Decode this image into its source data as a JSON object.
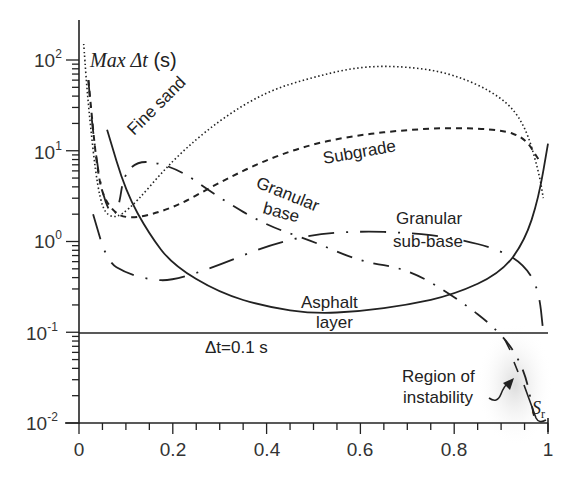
{
  "chart_data": {
    "type": "line",
    "title": "",
    "ylabel": "Max Δt (s)",
    "xlabel": "",
    "xlim": [
      0,
      1
    ],
    "ylim": [
      0.01,
      100
    ],
    "yscale": "log",
    "grid": false,
    "legend": "inline labels",
    "x_ticks": [
      "0",
      "0.2",
      "0.4",
      "0.6",
      "0.8",
      "1"
    ],
    "y_ticks": [
      {
        "base": "10",
        "exp": "2"
      },
      {
        "base": "10",
        "exp": "1"
      },
      {
        "base": "10",
        "exp": "0"
      },
      {
        "base": "10",
        "exp": "-1"
      },
      {
        "base": "10",
        "exp": "-2"
      }
    ],
    "series": [
      {
        "name": "Fine sand",
        "style": "dotted",
        "x": [
          0.01,
          0.02,
          0.04,
          0.06,
          0.1,
          0.2,
          0.3,
          0.4,
          0.5,
          0.6,
          0.7,
          0.8,
          0.9,
          0.95,
          0.98,
          0.99
        ],
        "y": [
          150,
          30,
          3.5,
          1.8,
          2.0,
          8,
          22,
          45,
          65,
          85,
          85,
          70,
          40,
          20,
          6,
          3
        ]
      },
      {
        "name": "Subgrade",
        "style": "dashed",
        "x": [
          0.02,
          0.04,
          0.06,
          0.1,
          0.2,
          0.3,
          0.4,
          0.5,
          0.6,
          0.7,
          0.8,
          0.9,
          0.95,
          0.98
        ],
        "y": [
          60,
          5,
          2.5,
          1.7,
          2.3,
          4.5,
          8,
          12,
          15,
          17,
          18,
          17,
          14,
          8
        ]
      },
      {
        "name": "Asphalt layer",
        "style": "solid",
        "x": [
          0.06,
          0.1,
          0.15,
          0.2,
          0.3,
          0.4,
          0.5,
          0.6,
          0.7,
          0.8,
          0.9,
          0.95,
          0.98,
          1.0
        ],
        "y": [
          17,
          3.5,
          1.2,
          0.55,
          0.27,
          0.19,
          0.16,
          0.17,
          0.2,
          0.26,
          0.45,
          1.0,
          3.0,
          12
        ]
      },
      {
        "name": "Granular base",
        "style": "dash-dot",
        "x": [
          0.02,
          0.03,
          0.05,
          0.08,
          0.1,
          0.2,
          0.3,
          0.4,
          0.5,
          0.6,
          0.7,
          0.8,
          0.9,
          0.95,
          0.97
        ],
        "y": [
          60,
          15,
          3,
          1.6,
          8,
          7,
          3,
          1.5,
          1.0,
          0.6,
          0.5,
          0.25,
          0.1,
          0.04,
          0.012
        ]
      },
      {
        "name": "Granular sub-base",
        "style": "long-dash-dot",
        "x": [
          0.03,
          0.06,
          0.1,
          0.15,
          0.2,
          0.3,
          0.4,
          0.5,
          0.6,
          0.7,
          0.8,
          0.9,
          0.95,
          0.98,
          0.99
        ],
        "y": [
          2.0,
          0.6,
          0.45,
          0.38,
          0.37,
          0.55,
          0.9,
          1.2,
          1.3,
          1.25,
          1.1,
          0.8,
          0.55,
          0.3,
          0.1
        ]
      }
    ],
    "annotations": [
      {
        "text": "Δt=0.1 s",
        "type": "hline",
        "y": 0.1
      },
      {
        "text": "Region of instability",
        "type": "arrow",
        "x": 0.93,
        "y": 0.03
      },
      {
        "text": "S_r",
        "type": "label",
        "x": 0.985,
        "y": 0.015
      }
    ]
  },
  "labels": {
    "ylabel_main": "Max Δt",
    "ylabel_unit": " (s)",
    "fine_sand": "Fine sand",
    "subgrade": "Subgrade",
    "granular_base_1": "Granular",
    "granular_base_2": "base",
    "granular_subbase_1": "Granular",
    "granular_subbase_2": "sub-base",
    "asphalt_1": "Asphalt",
    "asphalt_2": "layer",
    "dt_line": "Δt=0.1 s",
    "region_1": "Region of",
    "region_2": "instability",
    "sr_main": "S",
    "sr_sub": "r"
  },
  "axes": {
    "x_labels": [
      "0",
      "0.2",
      "0.4",
      "0.6",
      "0.8",
      "1"
    ],
    "y_base": "10",
    "y_exps": [
      "2",
      "1",
      "0",
      "-1",
      "-2"
    ]
  }
}
